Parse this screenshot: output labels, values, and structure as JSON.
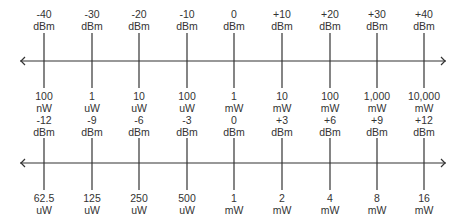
{
  "diagram": {
    "scales": [
      {
        "id": "decade",
        "ticks": [
          {
            "dbm": "-40",
            "dbm_unit": "dBm",
            "power": "100",
            "power_unit": "nW"
          },
          {
            "dbm": "-30",
            "dbm_unit": "dBm",
            "power": "1",
            "power_unit": "uW"
          },
          {
            "dbm": "-20",
            "dbm_unit": "dBm",
            "power": "10",
            "power_unit": "uW"
          },
          {
            "dbm": "-10",
            "dbm_unit": "dBm",
            "power": "100",
            "power_unit": "uW"
          },
          {
            "dbm": "0",
            "dbm_unit": "dBm",
            "power": "1",
            "power_unit": "mW"
          },
          {
            "dbm": "+10",
            "dbm_unit": "dBm",
            "power": "10",
            "power_unit": "mW"
          },
          {
            "dbm": "+20",
            "dbm_unit": "dBm",
            "power": "100",
            "power_unit": "mW"
          },
          {
            "dbm": "+30",
            "dbm_unit": "dBm",
            "power": "1,000",
            "power_unit": "mW"
          },
          {
            "dbm": "+40",
            "dbm_unit": "dBm",
            "power": "10,000",
            "power_unit": "mW"
          }
        ]
      },
      {
        "id": "3db-steps",
        "ticks": [
          {
            "dbm": "-12",
            "dbm_unit": "dBm",
            "power": "62.5",
            "power_unit": "uW"
          },
          {
            "dbm": "-9",
            "dbm_unit": "dBm",
            "power": "125",
            "power_unit": "uW"
          },
          {
            "dbm": "-6",
            "dbm_unit": "dBm",
            "power": "250",
            "power_unit": "uW"
          },
          {
            "dbm": "-3",
            "dbm_unit": "dBm",
            "power": "500",
            "power_unit": "uW"
          },
          {
            "dbm": "0",
            "dbm_unit": "dBm",
            "power": "1",
            "power_unit": "mW"
          },
          {
            "dbm": "+3",
            "dbm_unit": "dBm",
            "power": "2",
            "power_unit": "mW"
          },
          {
            "dbm": "+6",
            "dbm_unit": "dBm",
            "power": "4",
            "power_unit": "mW"
          },
          {
            "dbm": "+9",
            "dbm_unit": "dBm",
            "power": "8",
            "power_unit": "mW"
          },
          {
            "dbm": "+12",
            "dbm_unit": "dBm",
            "power": "16",
            "power_unit": "mW"
          }
        ]
      }
    ],
    "colors": {
      "line": "#333333",
      "text": "#333333",
      "background": "#ffffff"
    }
  }
}
